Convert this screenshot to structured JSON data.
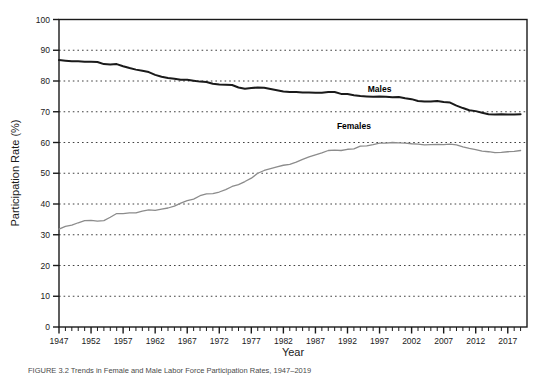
{
  "figure": {
    "caption": "FIGURE 3.2 Trends in Female and Male Labor Force Participation Rates, 1947–2019"
  },
  "chart_data": {
    "type": "line",
    "title": "",
    "xlabel": "Year",
    "ylabel": "Participation Rate (%)",
    "xlim": [
      1947,
      2020
    ],
    "ylim": [
      0,
      100
    ],
    "ytick_step": 10,
    "xtick_step": 1,
    "xlabel_step": 5,
    "grid": "horizontal-dotted",
    "legend_position": "inline-annotation",
    "yticks": [
      0,
      10,
      20,
      30,
      40,
      50,
      60,
      70,
      80,
      90,
      100
    ],
    "xticks": [
      1947,
      1952,
      1957,
      1962,
      1967,
      1972,
      1977,
      1982,
      1987,
      1992,
      1997,
      2002,
      2007,
      2012,
      2017
    ],
    "annotations": [
      {
        "name": "males-label",
        "text": "Males",
        "x": 1997,
        "y": 76.5
      },
      {
        "name": "females-label",
        "text": "Females",
        "x": 1993,
        "y": 64.5
      }
    ],
    "series": [
      {
        "name": "Males",
        "color": "#1a1a1a",
        "width": 2.0,
        "x": [
          1947,
          1948,
          1949,
          1950,
          1951,
          1952,
          1953,
          1954,
          1955,
          1956,
          1957,
          1958,
          1959,
          1960,
          1961,
          1962,
          1963,
          1964,
          1965,
          1966,
          1967,
          1968,
          1969,
          1970,
          1971,
          1972,
          1973,
          1974,
          1975,
          1976,
          1977,
          1978,
          1979,
          1980,
          1981,
          1982,
          1983,
          1984,
          1985,
          1986,
          1987,
          1988,
          1989,
          1990,
          1991,
          1992,
          1993,
          1994,
          1995,
          1996,
          1997,
          1998,
          1999,
          2000,
          2001,
          2002,
          2003,
          2004,
          2005,
          2006,
          2007,
          2008,
          2009,
          2010,
          2011,
          2012,
          2013,
          2014,
          2015,
          2016,
          2017,
          2018,
          2019
        ],
        "values": [
          86.8,
          86.6,
          86.4,
          86.4,
          86.3,
          86.3,
          86.2,
          85.5,
          85.4,
          85.5,
          84.8,
          84.2,
          83.7,
          83.3,
          82.9,
          82.0,
          81.4,
          81.0,
          80.7,
          80.4,
          80.4,
          80.1,
          79.8,
          79.7,
          79.1,
          78.9,
          78.8,
          78.7,
          77.9,
          77.5,
          77.7,
          77.9,
          77.8,
          77.4,
          77.0,
          76.6,
          76.4,
          76.4,
          76.3,
          76.3,
          76.2,
          76.2,
          76.4,
          76.4,
          75.8,
          75.8,
          75.4,
          75.1,
          75.0,
          74.9,
          75.0,
          74.9,
          74.7,
          74.8,
          74.4,
          74.1,
          73.5,
          73.3,
          73.3,
          73.5,
          73.2,
          73.0,
          72.0,
          71.2,
          70.5,
          70.2,
          69.7,
          69.2,
          69.1,
          69.2,
          69.1,
          69.1,
          69.2
        ]
      },
      {
        "name": "Females",
        "color": "#8c8c8c",
        "width": 1.3,
        "x": [
          1947,
          1948,
          1949,
          1950,
          1951,
          1952,
          1953,
          1954,
          1955,
          1956,
          1957,
          1958,
          1959,
          1960,
          1961,
          1962,
          1963,
          1964,
          1965,
          1966,
          1967,
          1968,
          1969,
          1970,
          1971,
          1972,
          1973,
          1974,
          1975,
          1976,
          1977,
          1978,
          1979,
          1980,
          1981,
          1982,
          1983,
          1984,
          1985,
          1986,
          1987,
          1988,
          1989,
          1990,
          1991,
          1992,
          1993,
          1994,
          1995,
          1996,
          1997,
          1998,
          1999,
          2000,
          2001,
          2002,
          2003,
          2004,
          2005,
          2006,
          2007,
          2008,
          2009,
          2010,
          2011,
          2012,
          2013,
          2014,
          2015,
          2016,
          2017,
          2018,
          2019
        ],
        "values": [
          31.8,
          32.7,
          33.1,
          33.9,
          34.6,
          34.7,
          34.4,
          34.6,
          35.7,
          36.9,
          36.9,
          37.1,
          37.1,
          37.7,
          38.1,
          37.9,
          38.3,
          38.7,
          39.3,
          40.3,
          41.1,
          41.6,
          42.7,
          43.3,
          43.4,
          43.9,
          44.7,
          45.7,
          46.3,
          47.3,
          48.4,
          50.0,
          50.9,
          51.5,
          52.1,
          52.6,
          52.9,
          53.6,
          54.5,
          55.3,
          56.0,
          56.6,
          57.4,
          57.5,
          57.4,
          57.8,
          57.9,
          58.8,
          58.9,
          59.3,
          59.8,
          59.8,
          60.0,
          59.9,
          59.8,
          59.6,
          59.5,
          59.2,
          59.3,
          59.4,
          59.3,
          59.5,
          59.2,
          58.6,
          58.1,
          57.7,
          57.2,
          57.0,
          56.7,
          56.8,
          57.0,
          57.1,
          57.4
        ]
      }
    ]
  }
}
